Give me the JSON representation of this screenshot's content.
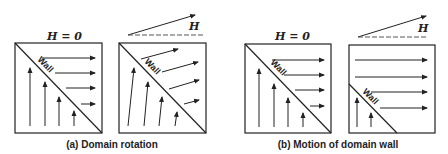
{
  "figure": {
    "panels": [
      {
        "id": "a-left",
        "field_label": "H = 0",
        "wall_label": "Wall"
      },
      {
        "id": "a-right",
        "field_label": "H",
        "wall_label": "Wall"
      },
      {
        "id": "b-left",
        "field_label": "H = 0",
        "wall_label": "Wall"
      },
      {
        "id": "b-right",
        "field_label": "H",
        "wall_label": "Wall"
      }
    ],
    "captions": {
      "a": "(a) Domain rotation",
      "b": "(b) Motion of domain wall"
    }
  },
  "colors": {
    "line": "#222222",
    "dash": "#555555",
    "background": "#ffffff"
  }
}
